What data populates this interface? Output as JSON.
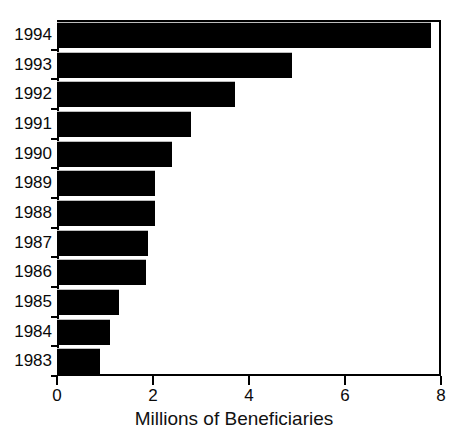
{
  "chart_data": {
    "type": "bar",
    "orientation": "horizontal",
    "title": "",
    "xlabel": "Millions of Beneficiaries",
    "ylabel": "",
    "xlim": [
      0,
      8
    ],
    "xticks": [
      0,
      2,
      4,
      6,
      8
    ],
    "xtick_labels": [
      "0",
      "2",
      "4",
      "6",
      "8"
    ],
    "grid": false,
    "legend": false,
    "bar_color": "#000000",
    "frame_color": "#000000",
    "background": "#ffffff",
    "categories": [
      "1994",
      "1993",
      "1992",
      "1991",
      "1990",
      "1989",
      "1988",
      "1987",
      "1986",
      "1985",
      "1984",
      "1983"
    ],
    "values": [
      7.8,
      4.9,
      3.7,
      2.8,
      2.4,
      2.05,
      2.05,
      1.9,
      1.85,
      1.3,
      1.1,
      0.9
    ],
    "bars": [
      {
        "category": "1994",
        "value": 7.8
      },
      {
        "category": "1993",
        "value": 4.9
      },
      {
        "category": "1992",
        "value": 3.7
      },
      {
        "category": "1991",
        "value": 2.8
      },
      {
        "category": "1990",
        "value": 2.4
      },
      {
        "category": "1989",
        "value": 2.05
      },
      {
        "category": "1988",
        "value": 2.05
      },
      {
        "category": "1987",
        "value": 1.9
      },
      {
        "category": "1986",
        "value": 1.85
      },
      {
        "category": "1985",
        "value": 1.3
      },
      {
        "category": "1984",
        "value": 1.1
      },
      {
        "category": "1983",
        "value": 0.9
      }
    ]
  }
}
